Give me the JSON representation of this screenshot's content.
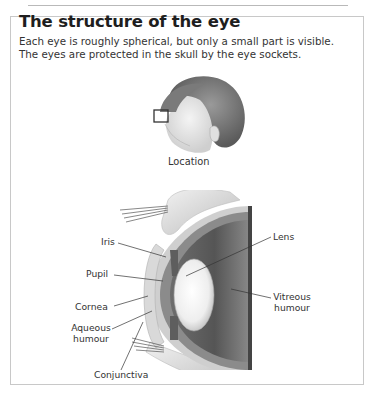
{
  "header": {
    "title": "The structure of the eye",
    "intro_lines": [
      "Each eye is roughly spherical, but only a small part is visible.",
      "The eyes are protected in the skull by the eye sockets."
    ]
  },
  "figure": {
    "location_caption": "Location",
    "labels": {
      "iris": "Iris",
      "pupil": "Pupil",
      "cornea": "Cornea",
      "aqueous_1": "Aqueous",
      "aqueous_2": "humour",
      "conjunctiva": "Conjunctiva",
      "lens": "Lens",
      "vitreous_1": "Vitreous",
      "vitreous_2": "humour"
    }
  }
}
